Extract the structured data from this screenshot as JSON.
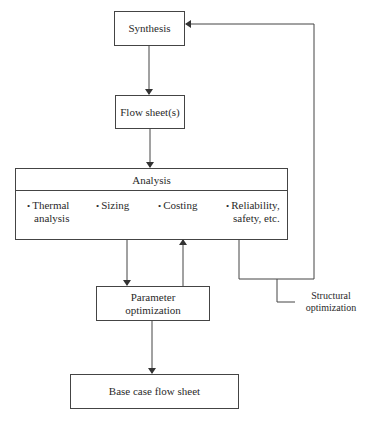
{
  "diagram": {
    "nodes": {
      "synthesis": "Synthesis",
      "flow_sheets": "Flow sheet(s)",
      "analysis": {
        "title": "Analysis",
        "items": [
          {
            "line1": "Thermal",
            "line2": "analysis"
          },
          {
            "line1": "Sizing",
            "line2": ""
          },
          {
            "line1": "Costing",
            "line2": ""
          },
          {
            "line1": "Reliability,",
            "line2": "safety, etc."
          }
        ]
      },
      "parameter_optimization": {
        "line1": "Parameter",
        "line2": "optimization"
      },
      "base_case": "Base case flow sheet"
    },
    "labels": {
      "structural_optimization": {
        "line1": "Structural",
        "line2": "optimization"
      }
    },
    "edges": [
      {
        "from": "Synthesis",
        "to": "Flow sheet(s)"
      },
      {
        "from": "Flow sheet(s)",
        "to": "Analysis"
      },
      {
        "from": "Analysis",
        "to": "Parameter optimization"
      },
      {
        "from": "Parameter optimization",
        "to": "Analysis"
      },
      {
        "from": "Analysis",
        "to": "Synthesis",
        "label": "Structural optimization"
      },
      {
        "from": "Parameter optimization",
        "to": "Base case flow sheet"
      }
    ],
    "bullet": "•"
  }
}
